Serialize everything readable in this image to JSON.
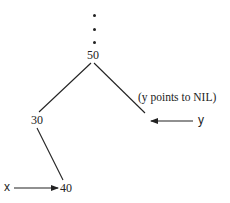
{
  "diagram": {
    "type": "binary-search-tree-fragment",
    "ellipsis": "⋮",
    "nodes": [
      {
        "id": "n50",
        "label": "50"
      },
      {
        "id": "n30",
        "label": "30"
      },
      {
        "id": "n40",
        "label": "40"
      }
    ],
    "edges": [
      {
        "from": "50",
        "to": "30"
      },
      {
        "from": "50",
        "to": "right-child (NIL)"
      },
      {
        "from": "30",
        "to": "40"
      }
    ],
    "pointers": {
      "x": {
        "label": "x",
        "points_to": "40"
      },
      "y": {
        "label": "y",
        "points_to": "NIL"
      }
    },
    "annotation": "(y points to NIL)",
    "colors": {
      "ink": "#222222",
      "background": "#ffffff"
    }
  }
}
